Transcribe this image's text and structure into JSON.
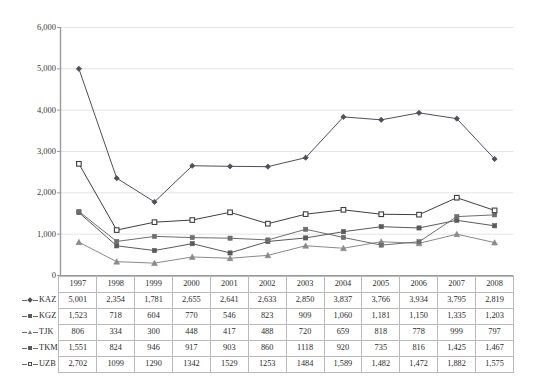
{
  "chart_data": {
    "type": "line",
    "title": "",
    "subtitle": "",
    "xlabel": "",
    "ylabel": "",
    "categories": [
      "1997",
      "1998",
      "1999",
      "2000",
      "2001",
      "2002",
      "2003",
      "2004",
      "2005",
      "2006",
      "2007",
      "2008"
    ],
    "ylim": [
      0,
      6000
    ],
    "y_ticks": [
      "0",
      "1,000",
      "2,000",
      "3,000",
      "4,000",
      "5,000",
      "6,000"
    ],
    "y_tick_values": [
      0,
      1000,
      2000,
      3000,
      4000,
      5000,
      6000
    ],
    "grid": true,
    "legend_position": "table-row-headers",
    "series": [
      {
        "name": "KAZ",
        "marker": "diamond",
        "color": "#4f4f5a",
        "values": [
          5001,
          2354,
          1781,
          2655,
          2641,
          2633,
          2850,
          3837,
          3766,
          3934,
          3795,
          2819
        ],
        "labels": [
          "5,001",
          "2,354",
          "1,781",
          "2,655",
          "2,641",
          "2,633",
          "2,850",
          "3,837",
          "3,766",
          "3,934",
          "3,795",
          "2,819"
        ]
      },
      {
        "name": "KGZ",
        "marker": "square-filled",
        "color": "#5a5a5a",
        "values": [
          1523,
          718,
          604,
          770,
          546,
          823,
          909,
          1060,
          1181,
          1150,
          1335,
          1203
        ],
        "labels": [
          "1,523",
          "718",
          "604",
          "770",
          "546",
          "823",
          "909",
          "1,060",
          "1,181",
          "1,150",
          "1,335",
          "1,203"
        ]
      },
      {
        "name": "TJK",
        "marker": "triangle",
        "color": "#8a8a8a",
        "values": [
          806,
          334,
          300,
          448,
          417,
          488,
          720,
          659,
          818,
          778,
          999,
          797
        ],
        "labels": [
          "806",
          "334",
          "300",
          "448",
          "417",
          "488",
          "720",
          "659",
          "818",
          "778",
          "999",
          "797"
        ]
      },
      {
        "name": "TKM",
        "marker": "square-filled",
        "color": "#6e6e6e",
        "values": [
          1551,
          824,
          946,
          917,
          903,
          860,
          1118,
          920,
          735,
          816,
          1425,
          1467
        ],
        "labels": [
          "1,551",
          "824",
          "946",
          "917",
          "903",
          "860",
          "1118",
          "920",
          "735",
          "816",
          "1,425",
          "1,467"
        ]
      },
      {
        "name": "UZB",
        "marker": "square-open",
        "color": "#3f3f3f",
        "values": [
          2702,
          1099,
          1290,
          1342,
          1529,
          1253,
          1484,
          1589,
          1482,
          1472,
          1882,
          1575
        ],
        "labels": [
          "2,702",
          "1099",
          "1290",
          "1342",
          "1529",
          "1253",
          "1484",
          "1,589",
          "1,482",
          "1,472",
          "1,882",
          "1,575"
        ]
      }
    ]
  },
  "table": {
    "corner_label": "",
    "year_headers": [
      "1997",
      "1998",
      "1999",
      "2000",
      "2001",
      "2002",
      "2003",
      "2004",
      "2005",
      "2006",
      "2007",
      "2008"
    ],
    "rows": [
      {
        "label": "KAZ",
        "marker": "diamond",
        "values": [
          "5,001",
          "2,354",
          "1,781",
          "2,655",
          "2,641",
          "2,633",
          "2,850",
          "3,837",
          "3,766",
          "3,934",
          "3,795",
          "2,819"
        ]
      },
      {
        "label": "KGZ",
        "marker": "square-filled",
        "values": [
          "1,523",
          "718",
          "604",
          "770",
          "546",
          "823",
          "909",
          "1,060",
          "1,181",
          "1,150",
          "1,335",
          "1,203"
        ]
      },
      {
        "label": "TJK",
        "marker": "triangle",
        "values": [
          "806",
          "334",
          "300",
          "448",
          "417",
          "488",
          "720",
          "659",
          "818",
          "778",
          "999",
          "797"
        ]
      },
      {
        "label": "TKM",
        "marker": "square-filled",
        "values": [
          "1,551",
          "824",
          "946",
          "917",
          "903",
          "860",
          "1118",
          "920",
          "735",
          "816",
          "1,425",
          "1,467"
        ]
      },
      {
        "label": "UZB",
        "marker": "square-open",
        "values": [
          "2,702",
          "1099",
          "1290",
          "1342",
          "1529",
          "1253",
          "1484",
          "1,589",
          "1,482",
          "1,472",
          "1,882",
          "1,575"
        ]
      }
    ]
  },
  "colors": {
    "axis": "#9a9a9a",
    "grid": "#e4e4e4",
    "table_border": "#b9b9b9",
    "text": "#2b2b2b"
  }
}
